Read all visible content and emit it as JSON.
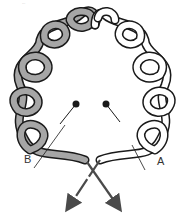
{
  "diagram": {
    "type": "knot-diagram",
    "caption": "...",
    "labels": {
      "left_end": "B",
      "right_end": "A"
    },
    "colors": {
      "grey_strand": "#a6a6a6",
      "white_strand": "#ffffff",
      "outline": "#1a1a1a",
      "arrow": "#4a4a4a",
      "pin": "#1a1a1a"
    },
    "elements": [
      "grey strand (B) looping left half",
      "white strand (A) looping right half",
      "two pins",
      "crossing arrows"
    ]
  }
}
